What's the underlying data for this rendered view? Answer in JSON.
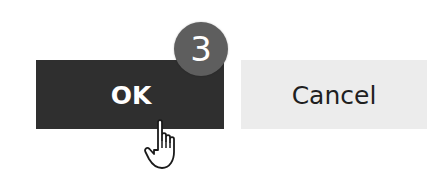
{
  "buttons": {
    "ok_label": "OK",
    "cancel_label": "Cancel"
  },
  "step_badge": {
    "number": "3"
  },
  "cursor": {
    "icon": "hand-pointer-icon"
  },
  "colors": {
    "ok_background": "#2f2f2f",
    "ok_text": "#ffffff",
    "cancel_background": "#ececec",
    "cancel_text": "#1f1f1f",
    "badge_background": "#5e5e5e",
    "badge_text": "#ffffff"
  }
}
